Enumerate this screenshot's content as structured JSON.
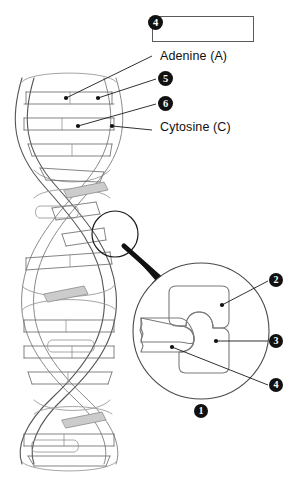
{
  "document": {
    "type": "biology-worksheet-diagram",
    "subject": "DNA double helix structure labeling exercise",
    "background_color": "#ffffff",
    "ink_color": "#111111",
    "line_color": "#5a5a5a",
    "shade_color": "#c9c9c9"
  },
  "answer_box": {
    "value": "",
    "placeholder": ""
  },
  "given_labels": [
    {
      "id": "adenine",
      "text": "Adenine (A)"
    },
    {
      "id": "cytosine",
      "text": "Cytosine (C)"
    }
  ],
  "callouts": [
    {
      "id": "callout-4-top",
      "number": "4",
      "target": "answer-box"
    },
    {
      "id": "callout-5",
      "number": "5",
      "target": "helix-base-upper"
    },
    {
      "id": "callout-6",
      "number": "6",
      "target": "helix-base-lower"
    },
    {
      "id": "callout-1",
      "number": "1",
      "target": "magnified-circle"
    },
    {
      "id": "callout-2",
      "number": "2",
      "target": "nucleotide-upper"
    },
    {
      "id": "callout-3",
      "number": "3",
      "target": "nucleotide-middle"
    },
    {
      "id": "callout-4-detail",
      "number": "4",
      "target": "nucleotide-lower-left"
    }
  ],
  "figure": {
    "helix_name": "dna-double-helix",
    "magnifier_name": "magnification-circle",
    "arrow_name": "zoom-arrow"
  }
}
